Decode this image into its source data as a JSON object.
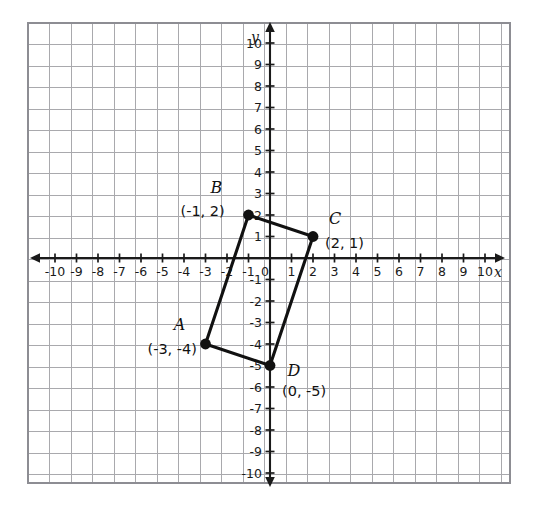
{
  "chart_data": {
    "type": "scatter",
    "title": "",
    "xlabel": "x",
    "ylabel": "y",
    "xlim": [
      -10,
      10
    ],
    "ylim": [
      -10,
      10
    ],
    "grid": true,
    "legend": null,
    "x_ticks": [
      -10,
      -9,
      -8,
      -7,
      -6,
      -5,
      -4,
      -3,
      -2,
      -1,
      0,
      1,
      2,
      3,
      4,
      5,
      6,
      7,
      8,
      9,
      10
    ],
    "y_ticks": [
      10,
      9,
      8,
      7,
      6,
      5,
      4,
      3,
      2,
      1,
      -1,
      -2,
      -3,
      -4,
      -5,
      -6,
      -7,
      -8,
      -9,
      -10
    ],
    "x_tick_labels": [
      "-10",
      "-9",
      "-8",
      "-7",
      "-6",
      "-5",
      "-4",
      "-3",
      "-2",
      "-1",
      "0",
      "1",
      "2",
      "3",
      "4",
      "5",
      "6",
      "7",
      "8",
      "9",
      "10"
    ],
    "y_tick_labels": [
      "10",
      "9",
      "8",
      "7",
      "6",
      "5",
      "4",
      "3",
      "2",
      "1",
      "-1",
      "-2",
      "-3",
      "-4",
      "-5",
      "-6",
      "-7",
      "-8",
      "-9",
      "-10"
    ],
    "series": [
      {
        "name": "Quadrilateral ABCD",
        "closed": true,
        "points": [
          {
            "label": "A",
            "coord_text": "(-3, -4)",
            "x": -3,
            "y": -4
          },
          {
            "label": "B",
            "coord_text": "(-1, 2)",
            "x": -1,
            "y": 2
          },
          {
            "label": "C",
            "coord_text": "(2, 1)",
            "x": 2,
            "y": 1
          },
          {
            "label": "D",
            "coord_text": "(0, -5)",
            "x": 0,
            "y": -5
          }
        ]
      }
    ]
  },
  "axes": {
    "x_axis_name": "x",
    "y_axis_name": "y",
    "origin_label": "0"
  },
  "vertices": [
    {
      "name": "A",
      "coord": "(-3, -4)",
      "x": -3,
      "y": -4,
      "name_dx": -26,
      "name_dy": -14,
      "coord_dx": -58,
      "coord_dy": 10
    },
    {
      "name": "B",
      "coord": "(-1, 2)",
      "x": -1,
      "y": 2,
      "name_dx": -32,
      "name_dy": -22,
      "coord_dx": -68,
      "coord_dy": 1
    },
    {
      "name": "C",
      "coord": "(2, 1)",
      "x": 2,
      "y": 1,
      "name_dx": 22,
      "name_dy": -13,
      "coord_dx": 12,
      "coord_dy": 11
    },
    {
      "name": "D",
      "coord": "(0, -5)",
      "x": 0,
      "y": -5,
      "name_dx": 24,
      "name_dy": 10,
      "coord_dx": 12,
      "coord_dy": 30
    }
  ],
  "colors": {
    "grid_major": "#a9a9ad",
    "grid_minor": "#c9c9ce",
    "grid_border": "#8d8d93",
    "axis": "#1a1a1a",
    "shape_stroke": "#111111",
    "vertex_fill": "#111111",
    "background": "#ffffff"
  }
}
